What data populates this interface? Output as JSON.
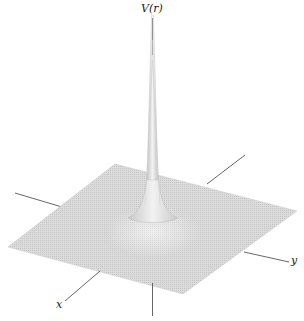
{
  "figure": {
    "type": "3d-surface-mesh",
    "labels": {
      "vertical_axis": "V(r)",
      "x_axis": "x",
      "y_axis": "y"
    },
    "colors": {
      "surface": "#d4d4d4",
      "mesh_line": "#b8b8b8",
      "axis_line": "#555555",
      "background": "#ffffff"
    }
  }
}
